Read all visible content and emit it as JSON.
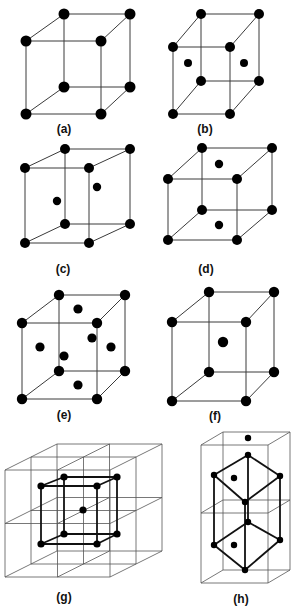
{
  "figure": {
    "colors": {
      "atom": "#000000",
      "edge": "#3a3a3a",
      "background": "#ffffff"
    },
    "panels": [
      {
        "id": "a",
        "label": "(a)",
        "label_pos": [
          64,
          122
        ],
        "corners": [
          [
            64,
            14
          ],
          [
            130,
            14
          ],
          [
            26,
            41
          ],
          [
            101,
            41
          ],
          [
            64,
            87
          ],
          [
            130,
            87
          ],
          [
            26,
            114
          ],
          [
            101,
            114
          ]
        ],
        "atom_r": 5.5,
        "extra_atoms": [],
        "extra_r": 4.2
      },
      {
        "id": "b",
        "label": "(b)",
        "label_pos": [
          205,
          122
        ],
        "corners": [
          [
            201,
            14
          ],
          [
            259,
            14
          ],
          [
            173,
            47
          ],
          [
            230,
            47
          ],
          [
            201,
            81
          ],
          [
            259,
            81
          ],
          [
            173,
            114
          ],
          [
            230,
            114
          ]
        ],
        "atom_r": 5,
        "extra_atoms": [
          [
            188,
            63
          ],
          [
            244,
            63
          ]
        ],
        "extra_r": 4
      },
      {
        "id": "c",
        "label": "(c)",
        "label_pos": [
          63,
          262
        ],
        "corners": [
          [
            65,
            149
          ],
          [
            130,
            149
          ],
          [
            25,
            168
          ],
          [
            89,
            168
          ],
          [
            65,
            224
          ],
          [
            130,
            224
          ],
          [
            25,
            243
          ],
          [
            89,
            243
          ]
        ],
        "atom_r": 5,
        "extra_atoms": [
          [
            57,
            201
          ],
          [
            97,
            187
          ]
        ],
        "extra_r": 4.2
      },
      {
        "id": "d",
        "label": "(d)",
        "label_pos": [
          206,
          262
        ],
        "corners": [
          [
            202,
            148
          ],
          [
            272,
            148
          ],
          [
            168,
            179
          ],
          [
            237,
            179
          ],
          [
            202,
            210
          ],
          [
            272,
            210
          ],
          [
            168,
            240
          ],
          [
            237,
            240
          ]
        ],
        "atom_r": 5,
        "extra_atoms": [
          [
            219,
            164
          ],
          [
            219,
            225
          ]
        ],
        "extra_r": 4.2
      },
      {
        "id": "e",
        "label": "(e)",
        "label_pos": [
          64,
          408
        ],
        "corners": [
          [
            59,
            295
          ],
          [
            125,
            295
          ],
          [
            22,
            323
          ],
          [
            97,
            323
          ],
          [
            59,
            371
          ],
          [
            125,
            371
          ],
          [
            22,
            399
          ],
          [
            97,
            399
          ]
        ],
        "atom_r": 5.2,
        "extra_atoms": [
          [
            78,
            309
          ],
          [
            40,
            347
          ],
          [
            111,
            347
          ],
          [
            78,
            385
          ],
          [
            64,
            356
          ],
          [
            92,
            338
          ]
        ],
        "extra_r": 4.6
      },
      {
        "id": "f",
        "label": "(f)",
        "label_pos": [
          215,
          409
        ],
        "corners": [
          [
            209,
            292
          ],
          [
            274,
            292
          ],
          [
            172,
            322
          ],
          [
            246,
            322
          ],
          [
            209,
            372
          ],
          [
            274,
            372
          ],
          [
            172,
            401
          ],
          [
            246,
            401
          ]
        ],
        "atom_r": 5.2,
        "extra_atoms": [
          [
            223,
            342
          ]
        ],
        "extra_r": 5.2
      }
    ],
    "panel_g": {
      "id": "g",
      "label": "(g)",
      "label_pos": [
        64,
        590
      ],
      "grid": {
        "front": [
          5,
          470,
          110,
          577
        ],
        "depth_offset": [
          52,
          -26
        ]
      },
      "inner_cube": [
        [
          64,
          477
        ],
        [
          117,
          477
        ],
        [
          41,
          486
        ],
        [
          97,
          486
        ],
        [
          64,
          534
        ],
        [
          117,
          534
        ],
        [
          41,
          544
        ],
        [
          97,
          544
        ]
      ],
      "center_atom": [
        83,
        510
      ],
      "atom_r": 3.6
    },
    "panel_h": {
      "id": "h",
      "label": "(h)",
      "label_pos": [
        241,
        592
      ],
      "box": {
        "front": [
          201,
          445,
          268,
          583
        ],
        "depth_offset": [
          22,
          -13
        ],
        "mid_front_y": 513
      },
      "hex_atoms": [
        [
          248,
          455
        ],
        [
          214,
          475
        ],
        [
          280,
          476
        ],
        [
          245,
          502
        ],
        [
          248,
          522
        ],
        [
          214,
          545
        ],
        [
          280,
          540
        ],
        [
          245,
          570
        ]
      ],
      "inner_atoms": [
        [
          234,
          478
        ],
        [
          234,
          545
        ],
        [
          248,
          438
        ]
      ],
      "atom_r": 3.2
    }
  }
}
